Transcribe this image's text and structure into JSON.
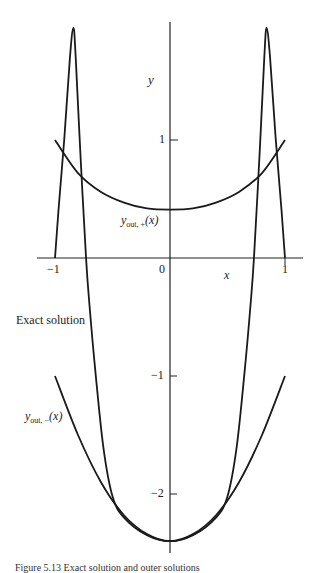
{
  "chart_data": {
    "type": "line",
    "title": "",
    "xlabel": "x",
    "ylabel": "y",
    "xlim": [
      -1.1,
      1.15
    ],
    "ylim": [
      -2.5,
      2.0
    ],
    "x_ticks": [
      "-1",
      "0",
      "1"
    ],
    "y_ticks": [
      "1",
      "-1",
      "-2"
    ],
    "grid": false,
    "series": [
      {
        "name": "Exact solution",
        "x": [
          -1.0,
          -0.97,
          -0.92,
          -0.87,
          -0.84,
          -0.82,
          -0.78,
          -0.73,
          -0.7,
          -0.65,
          -0.58,
          -0.5,
          -0.4,
          -0.2,
          0.0,
          0.2,
          0.4,
          0.5,
          0.58,
          0.65,
          0.7,
          0.73,
          0.78,
          0.82,
          0.84,
          0.87,
          0.92,
          0.97,
          1.0
        ],
        "values": [
          0.0,
          0.4,
          1.0,
          1.7,
          1.95,
          1.7,
          0.9,
          0.0,
          -0.4,
          -0.95,
          -1.6,
          -2.02,
          -2.2,
          -2.35,
          -2.4,
          -2.35,
          -2.2,
          -2.02,
          -1.6,
          -0.95,
          -0.4,
          0.0,
          0.9,
          1.7,
          1.95,
          1.7,
          1.0,
          0.4,
          0.0
        ]
      },
      {
        "name": "y_out,+(x)",
        "x": [
          -1.0,
          -0.8,
          -0.6,
          -0.4,
          -0.2,
          0.0,
          0.2,
          0.4,
          0.6,
          0.8,
          1.0
        ],
        "values": [
          1.0,
          0.72,
          0.56,
          0.47,
          0.42,
          0.41,
          0.42,
          0.47,
          0.56,
          0.72,
          1.0
        ]
      },
      {
        "name": "y_out,-(x)",
        "x": [
          -1.0,
          -0.8,
          -0.6,
          -0.4,
          -0.2,
          0.0,
          0.2,
          0.4,
          0.6,
          0.8,
          1.0
        ],
        "values": [
          -1.0,
          -1.5,
          -1.9,
          -2.18,
          -2.34,
          -2.4,
          -2.34,
          -2.18,
          -1.9,
          -1.5,
          -1.0
        ]
      }
    ],
    "annotations": [
      "Exact solution",
      "y_out,+(x)",
      "y_out,-(x)"
    ]
  },
  "labels": {
    "y_axis": "y",
    "x_axis": "x",
    "tick_1": "1",
    "tick_m1": "−1",
    "tick_m2": "−2",
    "xtick_m1": "−1",
    "xtick_0": "0",
    "xtick_1": "1",
    "exact": "Exact solution",
    "yout_plus_main": "y",
    "yout_plus_sub": "out, +",
    "yout_plus_arg": "(x)",
    "yout_minus_main": "y",
    "yout_minus_sub": "out, −",
    "yout_minus_arg": "(x)",
    "caption": "Figure 5.13 Exact solution and outer solutions"
  }
}
